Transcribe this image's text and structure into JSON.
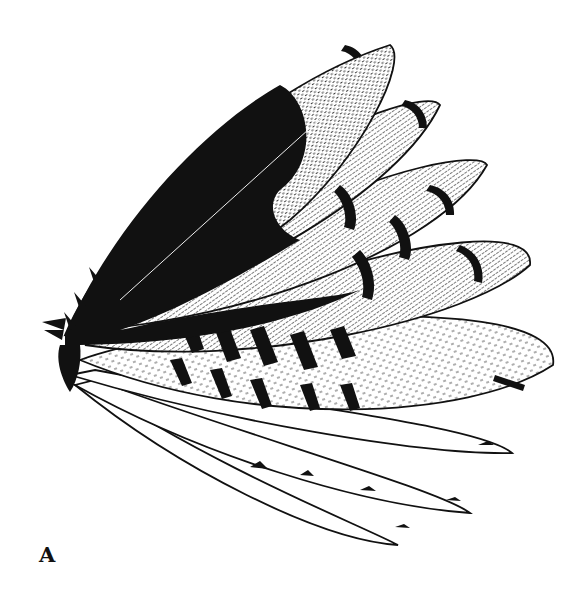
{
  "figure": {
    "panel_label": "A",
    "style": "black-and-white stipple and hatch drawing",
    "colors": {
      "ink": "#111111",
      "paper": "#ffffff"
    }
  }
}
